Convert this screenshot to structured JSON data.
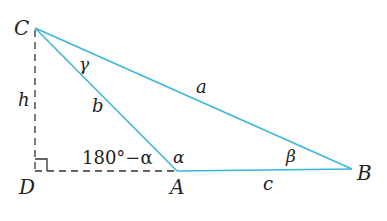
{
  "diagram": {
    "colors": {
      "side": "#3ab7d8",
      "construction": "#333333",
      "text": "#222222"
    },
    "vertices": {
      "C": {
        "label": "C",
        "x": 35,
        "y": 28
      },
      "D": {
        "label": "D",
        "x": 35,
        "y": 171
      },
      "A": {
        "label": "A",
        "x": 177,
        "y": 171
      },
      "B": {
        "label": "B",
        "x": 352,
        "y": 169
      }
    },
    "sides": {
      "a": "a",
      "b": "b",
      "c": "c",
      "h": "h"
    },
    "angles": {
      "alpha": "α",
      "beta": "β",
      "gamma": "γ",
      "exterior": "180°−α"
    }
  }
}
